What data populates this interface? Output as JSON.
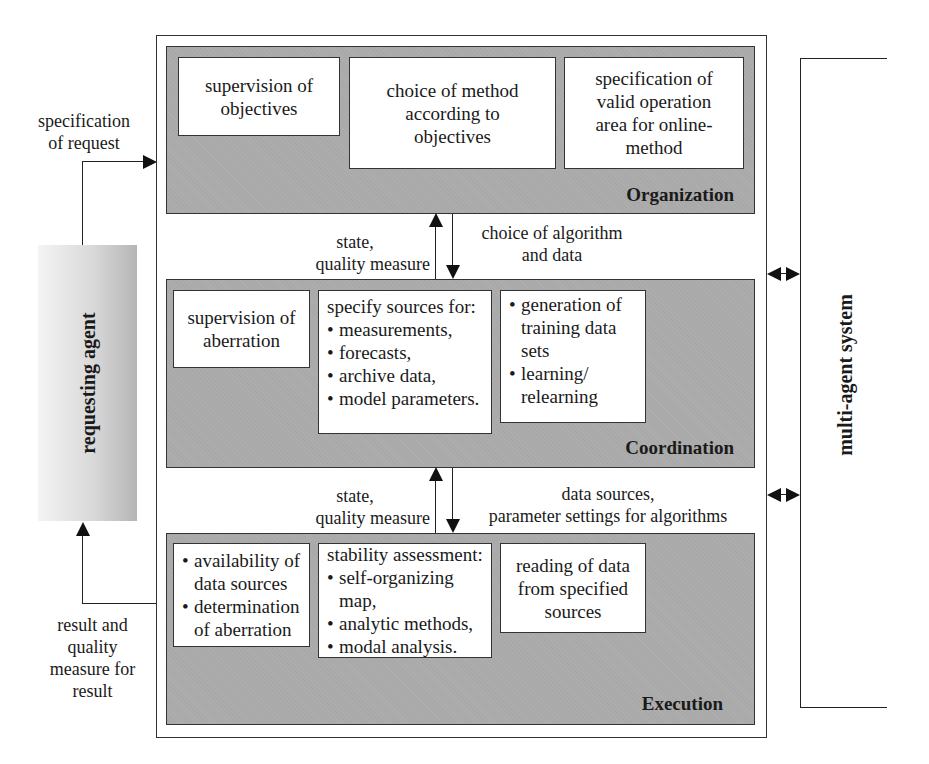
{
  "layers": {
    "organization": {
      "label": "Organization",
      "boxes": [
        {
          "text": "supervision of objectives",
          "lines": [
            "supervision of",
            "objectives"
          ]
        },
        {
          "text": "choice of method according to objectives",
          "lines": [
            "choice of method",
            "according to",
            "objectives"
          ]
        },
        {
          "text": "specification of valid operation area for online-method",
          "lines": [
            "specification of",
            "valid operation",
            "area for online-",
            "method"
          ]
        }
      ]
    },
    "coordination": {
      "label": "Coordination",
      "boxes": [
        {
          "lines": [
            "supervision of",
            "aberration"
          ]
        },
        {
          "heading": "specify sources for:",
          "bullets": [
            "measurements,",
            "forecasts,",
            "archive data,",
            "model parameters."
          ]
        },
        {
          "bullets": [
            "generation of training data sets",
            "learning/ relearning"
          ]
        }
      ]
    },
    "execution": {
      "label": "Execution",
      "boxes": [
        {
          "bullets": [
            "availability of data sources",
            "determination of aberration"
          ]
        },
        {
          "heading": "stability assessment:",
          "bullets": [
            "self-organizing map,",
            "analytic methods,",
            "modal analysis."
          ]
        },
        {
          "lines": [
            "reading of data",
            "from specified",
            "sources"
          ]
        }
      ]
    }
  },
  "flows": {
    "org_coord_up": {
      "lines": [
        "state,",
        "quality measure"
      ]
    },
    "org_coord_down": {
      "lines": [
        "choice of algorithm",
        "and data"
      ]
    },
    "coord_exec_up": {
      "lines": [
        "state,",
        "quality measure"
      ]
    },
    "coord_exec_down": {
      "lines": [
        "data sources,",
        "parameter settings for algorithms"
      ]
    },
    "request_in": {
      "lines": [
        "specification",
        "of request"
      ]
    },
    "result_out": {
      "lines": [
        "result and",
        "quality",
        "measure for",
        "result"
      ]
    }
  },
  "actors": {
    "requesting_agent": {
      "label": "requesting agent"
    },
    "multi_agent_system": {
      "label": "multi-agent system"
    }
  },
  "colors": {
    "layer_fill": "#a9a9a9",
    "box_fill": "#ffffff",
    "stroke": "#333333"
  }
}
